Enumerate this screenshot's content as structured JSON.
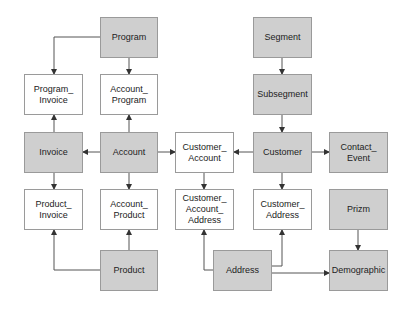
{
  "diagram": {
    "nodes": [
      {
        "id": "program",
        "label": "Program",
        "type": "entity",
        "x": 100,
        "y": 17,
        "w": 58,
        "h": 41
      },
      {
        "id": "segment",
        "label": "Segment",
        "type": "entity",
        "x": 253,
        "y": 17,
        "w": 59,
        "h": 41
      },
      {
        "id": "program_invoice",
        "label": "Program_\nInvoice",
        "type": "link",
        "x": 24,
        "y": 74,
        "w": 59,
        "h": 41
      },
      {
        "id": "account_program",
        "label": "Account_\nProgram",
        "type": "link",
        "x": 100,
        "y": 74,
        "w": 58,
        "h": 41
      },
      {
        "id": "subsegment",
        "label": "Subsegment",
        "type": "entity",
        "x": 253,
        "y": 74,
        "w": 59,
        "h": 41
      },
      {
        "id": "invoice",
        "label": "Invoice",
        "type": "entity",
        "x": 24,
        "y": 132,
        "w": 59,
        "h": 41
      },
      {
        "id": "account",
        "label": "Account",
        "type": "entity",
        "x": 100,
        "y": 132,
        "w": 58,
        "h": 41
      },
      {
        "id": "customer_account",
        "label": "Customer_\nAccount",
        "type": "link",
        "x": 175,
        "y": 132,
        "w": 59,
        "h": 41
      },
      {
        "id": "customer",
        "label": "Customer",
        "type": "entity",
        "x": 253,
        "y": 132,
        "w": 59,
        "h": 41
      },
      {
        "id": "contact_event",
        "label": "Contact_\nEvent",
        "type": "entity",
        "x": 329,
        "y": 132,
        "w": 59,
        "h": 41
      },
      {
        "id": "product_invoice",
        "label": "Product_\nInvoice",
        "type": "link",
        "x": 24,
        "y": 189,
        "w": 59,
        "h": 41
      },
      {
        "id": "account_product",
        "label": "Account_\nProduct",
        "type": "link",
        "x": 100,
        "y": 189,
        "w": 58,
        "h": 41
      },
      {
        "id": "customer_account_address",
        "label": "Customer_\nAccount_\nAddress",
        "type": "link",
        "x": 175,
        "y": 189,
        "w": 59,
        "h": 41
      },
      {
        "id": "customer_address",
        "label": "Customer_\nAddress",
        "type": "link",
        "x": 253,
        "y": 189,
        "w": 59,
        "h": 41
      },
      {
        "id": "prizm",
        "label": "Prizm",
        "type": "entity",
        "x": 329,
        "y": 189,
        "w": 59,
        "h": 41
      },
      {
        "id": "product",
        "label": "Product",
        "type": "entity",
        "x": 100,
        "y": 250,
        "w": 58,
        "h": 41
      },
      {
        "id": "address",
        "label": "Address",
        "type": "entity",
        "x": 213,
        "y": 250,
        "w": 59,
        "h": 41
      },
      {
        "id": "demographic",
        "label": "Demographic",
        "type": "entity",
        "x": 329,
        "y": 250,
        "w": 59,
        "h": 41
      }
    ],
    "edges": [
      {
        "from": "program",
        "to": "program_invoice",
        "points": [
          [
            100,
            37
          ],
          [
            54,
            37
          ],
          [
            54,
            74
          ]
        ]
      },
      {
        "from": "program",
        "to": "account_program",
        "points": [
          [
            129,
            58
          ],
          [
            129,
            74
          ]
        ]
      },
      {
        "from": "segment",
        "to": "subsegment",
        "points": [
          [
            282,
            58
          ],
          [
            282,
            74
          ]
        ]
      },
      {
        "from": "subsegment",
        "to": "customer",
        "points": [
          [
            282,
            115
          ],
          [
            282,
            132
          ]
        ]
      },
      {
        "from": "invoice",
        "to": "program_invoice",
        "points": [
          [
            54,
            132
          ],
          [
            54,
            115
          ]
        ]
      },
      {
        "from": "account",
        "to": "account_program",
        "points": [
          [
            129,
            132
          ],
          [
            129,
            115
          ]
        ]
      },
      {
        "from": "account",
        "to": "invoice",
        "points": [
          [
            100,
            152
          ],
          [
            83,
            152
          ]
        ]
      },
      {
        "from": "account",
        "to": "customer_account",
        "points": [
          [
            158,
            152
          ],
          [
            175,
            152
          ]
        ]
      },
      {
        "from": "customer",
        "to": "customer_account",
        "points": [
          [
            253,
            152
          ],
          [
            234,
            152
          ]
        ]
      },
      {
        "from": "customer",
        "to": "contact_event",
        "points": [
          [
            312,
            152
          ],
          [
            329,
            152
          ]
        ]
      },
      {
        "from": "invoice",
        "to": "product_invoice",
        "points": [
          [
            54,
            173
          ],
          [
            54,
            189
          ]
        ]
      },
      {
        "from": "account",
        "to": "account_product",
        "points": [
          [
            129,
            173
          ],
          [
            129,
            189
          ]
        ]
      },
      {
        "from": "customer_account",
        "to": "customer_account_address",
        "points": [
          [
            204,
            173
          ],
          [
            204,
            189
          ]
        ]
      },
      {
        "from": "customer",
        "to": "customer_address",
        "points": [
          [
            282,
            173
          ],
          [
            282,
            189
          ]
        ]
      },
      {
        "from": "product",
        "to": "product_invoice",
        "points": [
          [
            100,
            270
          ],
          [
            54,
            270
          ],
          [
            54,
            230
          ]
        ]
      },
      {
        "from": "product",
        "to": "account_product",
        "points": [
          [
            129,
            250
          ],
          [
            129,
            230
          ]
        ]
      },
      {
        "from": "address",
        "to": "customer_account_address",
        "points": [
          [
            213,
            270
          ],
          [
            204,
            270
          ],
          [
            204,
            230
          ]
        ]
      },
      {
        "from": "address",
        "to": "customer_address",
        "points": [
          [
            272,
            266
          ],
          [
            282,
            266
          ],
          [
            282,
            230
          ]
        ]
      },
      {
        "from": "address",
        "to": "demographic",
        "points": [
          [
            272,
            273
          ],
          [
            329,
            273
          ]
        ]
      },
      {
        "from": "prizm",
        "to": "demographic",
        "points": [
          [
            358,
            230
          ],
          [
            358,
            250
          ]
        ]
      }
    ],
    "colors": {
      "entity_fill": "#cfcfcf",
      "link_fill": "#ffffff",
      "border": "#9a9a9a",
      "edge": "#555555"
    }
  }
}
